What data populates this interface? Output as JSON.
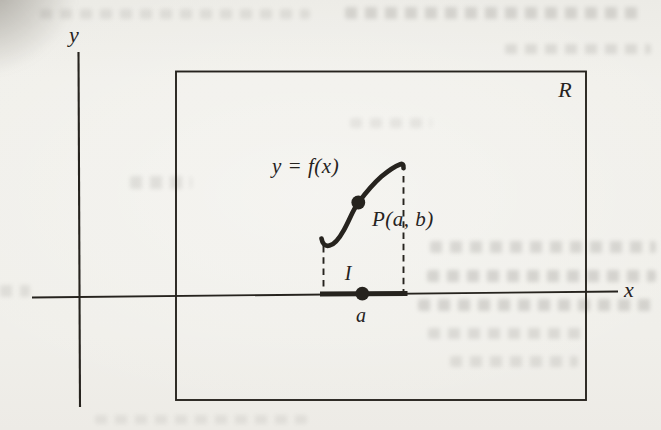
{
  "figure": {
    "y_axis_label": "y",
    "x_axis_label": "x",
    "rectangle_label": "R",
    "curve_label": "y = f(x)",
    "point_label": "P(a, b)",
    "interval_label": "I",
    "abscissa_label": "a"
  },
  "colors": {
    "ink": "#26231e",
    "paper": "#f0efea"
  }
}
